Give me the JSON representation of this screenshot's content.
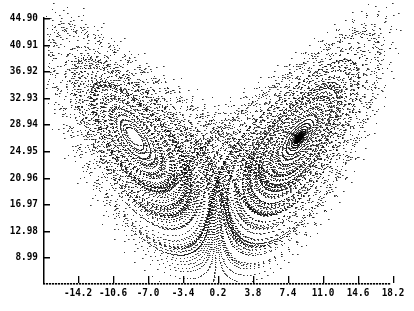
{
  "chart_data": {
    "type": "scatter",
    "title": "",
    "subtitle": "",
    "xlabel": "",
    "ylabel": "",
    "grid": false,
    "legend": null,
    "x_ticks": [
      "-14.2",
      "-10.6",
      "-7.0",
      "-3.4",
      "0.2",
      "3.8",
      "7.4",
      "11.0",
      "14.6",
      "18.2"
    ],
    "y_ticks": [
      "44.90",
      "40.91",
      "36.92",
      "32.93",
      "28.94",
      "24.95",
      "20.96",
      "16.97",
      "12.98",
      "8.99"
    ],
    "xlim": [
      -17.8,
      18.2
    ],
    "ylim": [
      5.0,
      44.9
    ],
    "series": [
      {
        "name": "trajectory",
        "generator": "lorenz",
        "params": {
          "sigma": 10,
          "rho": 28,
          "beta": 2.6667
        },
        "color": "#000000",
        "marker": "dot"
      }
    ]
  }
}
